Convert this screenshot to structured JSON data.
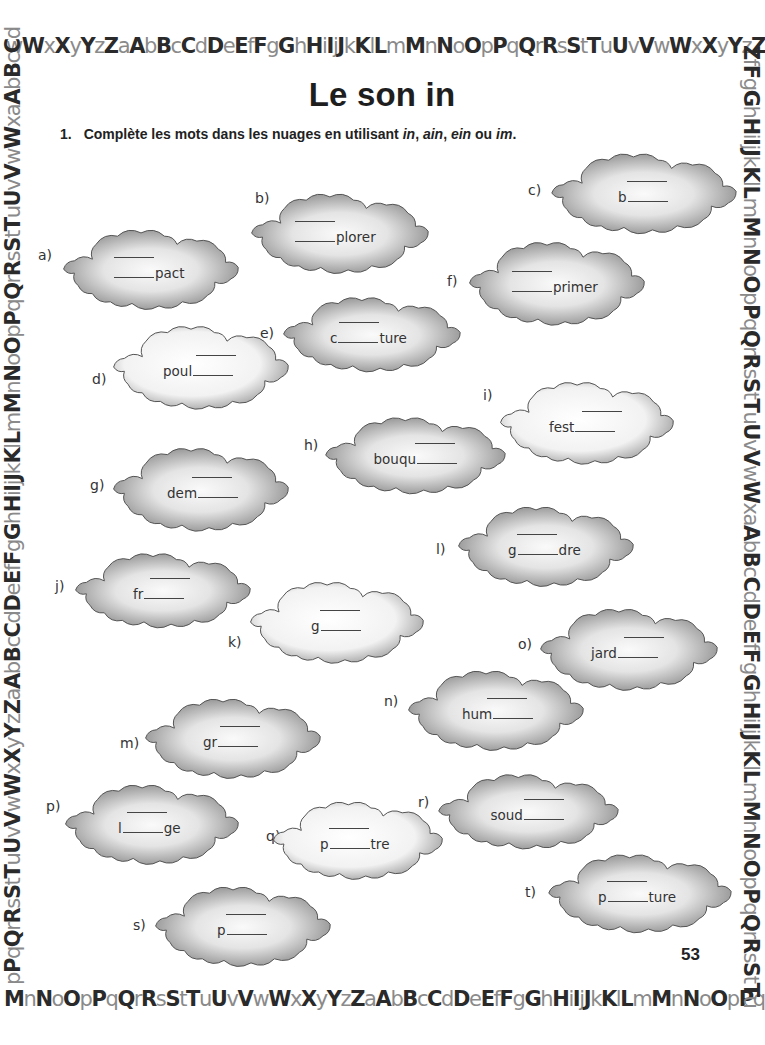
{
  "border": {
    "top": "wWxXyYzZaAbBcCdDeEfFgGhHiIjJkKlLmMnNoOpPqQrRsStTuUvVwWxXyYzZ",
    "bottom": "MnNoOpPqQrRsStTuUvVwWxXyYzZaAbBcCdDeEfFgGhHiIjJkKlLmMnNoOpPq",
    "left": "pPqQrRsStTuUvVwWxXyYzZaAbBcCdDeEfFgGhHiIjJkKlLmMnNoOpPqQrRsStTuUvVwWxaAbBcCd",
    "right": "ZfFgGhHiIjJkKlLmMnNoOpPqQrRsStTuUvVwWxaAbBcCdDeEfFgGhHiIjJkKlLmMnNoOpPqQrRsStTu"
  },
  "title": "Le son in",
  "instruction": {
    "number": "1.",
    "text_before": "Complète les mots dans les nuages en utilisant ",
    "opt1": "in",
    "sep1": ", ",
    "opt2": "ain",
    "sep2": ", ",
    "opt3": "ein",
    "sep3": " ou ",
    "opt4": "im",
    "text_after": "."
  },
  "page_number": "53",
  "colors": {
    "cloud_dark": "#8c8c8c",
    "cloud_light": "#f4f4f4",
    "cloud_outline": "#555555",
    "text": "#333333"
  },
  "items": [
    {
      "label": "a)",
      "prefix": "",
      "suffix": "pact"
    },
    {
      "label": "b)",
      "prefix": "",
      "suffix": "plorer"
    },
    {
      "label": "c)",
      "prefix": "b",
      "suffix": ""
    },
    {
      "label": "d)",
      "prefix": "poul",
      "suffix": ""
    },
    {
      "label": "e)",
      "prefix": "c",
      "suffix": "ture"
    },
    {
      "label": "f)",
      "prefix": "",
      "suffix": "primer"
    },
    {
      "label": "g)",
      "prefix": "dem",
      "suffix": ""
    },
    {
      "label": "h)",
      "prefix": "bouqu",
      "suffix": ""
    },
    {
      "label": "i)",
      "prefix": "fest",
      "suffix": ""
    },
    {
      "label": "j)",
      "prefix": "fr",
      "suffix": ""
    },
    {
      "label": "k)",
      "prefix": "g",
      "suffix": ""
    },
    {
      "label": "l)",
      "prefix": "g",
      "suffix": "dre"
    },
    {
      "label": "m)",
      "prefix": "gr",
      "suffix": ""
    },
    {
      "label": "n)",
      "prefix": "hum",
      "suffix": ""
    },
    {
      "label": "o)",
      "prefix": "jard",
      "suffix": ""
    },
    {
      "label": "p)",
      "prefix": "l",
      "suffix": "ge"
    },
    {
      "label": "q)",
      "prefix": "p",
      "suffix": "tre"
    },
    {
      "label": "r)",
      "prefix": "soud",
      "suffix": ""
    },
    {
      "label": "s)",
      "prefix": "p",
      "suffix": ""
    },
    {
      "label": "t)",
      "prefix": "p",
      "suffix": "ture"
    }
  ]
}
